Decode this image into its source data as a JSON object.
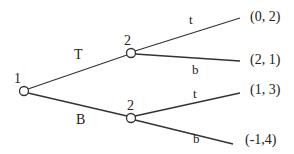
{
  "diagram": {
    "type": "extensive-form-game-tree",
    "colors": {
      "line": "#333333",
      "node_fill": "#ffffff",
      "text": "#222222"
    },
    "nodes": [
      {
        "id": "root",
        "player": "1",
        "x": 24,
        "y": 91
      },
      {
        "id": "upper",
        "player": "2",
        "x": 131,
        "y": 53
      },
      {
        "id": "lower",
        "player": "2",
        "x": 131,
        "y": 118
      }
    ],
    "player_labels": {
      "root": "1",
      "upper": "2",
      "lower": "2"
    },
    "actions": {
      "root_top": "T",
      "root_bottom": "B",
      "upper_top": "t",
      "upper_bottom": "b",
      "lower_top": "t",
      "lower_bottom": "b"
    },
    "payoffs": {
      "Tt": "(0, 2)",
      "Tb": "(2, 1)",
      "Bt": "(1, 3)",
      "Bb": "(-1,4)"
    }
  }
}
